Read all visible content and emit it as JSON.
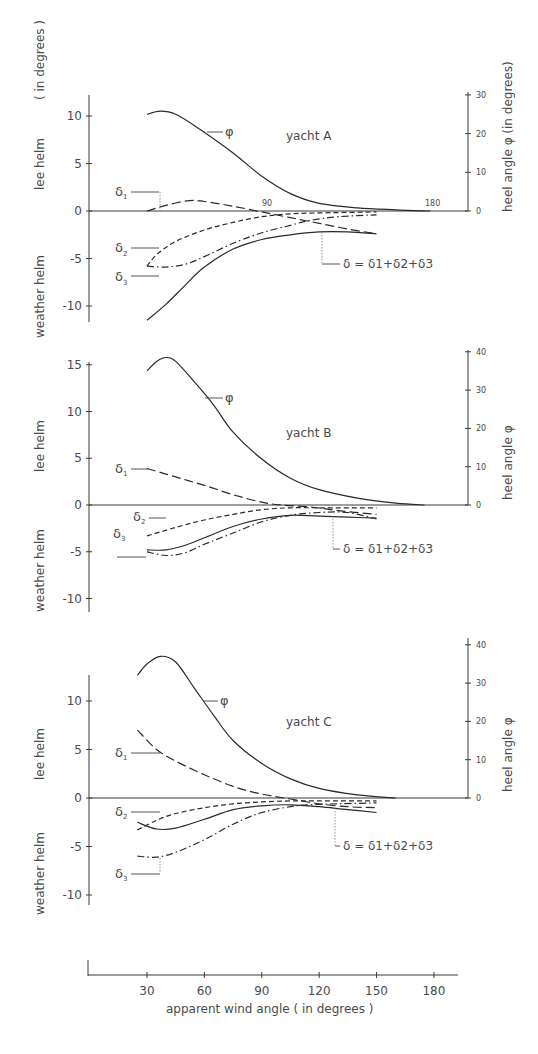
{
  "figure": {
    "x_axis_label": "apparent wind angle ( in degrees )",
    "x_ticks": [
      "30",
      "60",
      "90",
      "120",
      "150",
      "180"
    ],
    "left_axis_label_upper": "lee helm",
    "left_axis_label_lower": "weather helm",
    "left_axis_unit": "( in degrees )",
    "right_axis_label_A": "heel angle φ (in degrees)",
    "right_axis_label_BC": "heel angle φ",
    "formula": "δ = δ1+δ2+δ3",
    "phi_label": "φ"
  },
  "chart_data": [
    {
      "type": "line",
      "title": "yacht A",
      "xlabel": "apparent wind angle (in degrees)",
      "ylabel": "lee helm / weather helm (in degrees)",
      "ylabel_right": "heel angle φ (in degrees)",
      "left_ticks": [
        10,
        5,
        0,
        -5,
        -10
      ],
      "right_ticks": [
        0,
        10,
        20,
        30
      ],
      "inline_x_ticks": [
        "90",
        "180"
      ],
      "ylim": [
        -11.5,
        12
      ],
      "ylim_right": [
        0,
        30
      ],
      "series": [
        {
          "name": "φ",
          "axis": "right",
          "style": "solid",
          "points": [
            [
              30,
              25
            ],
            [
              37,
              25.8
            ],
            [
              45,
              25
            ],
            [
              58,
              21
            ],
            [
              75,
              15
            ],
            [
              90,
              9
            ],
            [
              105,
              4.5
            ],
            [
              120,
              2
            ],
            [
              140,
              0.8
            ],
            [
              160,
              0.3
            ],
            [
              178,
              0
            ]
          ]
        },
        {
          "name": "δ1",
          "axis": "left",
          "style": "longdash",
          "points": [
            [
              30,
              0
            ],
            [
              40,
              0.6
            ],
            [
              52,
              1.1
            ],
            [
              60,
              1
            ],
            [
              75,
              0.5
            ],
            [
              90,
              -0.1
            ],
            [
              105,
              -0.7
            ],
            [
              120,
              -1.3
            ],
            [
              135,
              -1.9
            ],
            [
              150,
              -2.4
            ]
          ]
        },
        {
          "name": "δ2",
          "axis": "left",
          "style": "dash",
          "points": [
            [
              30,
              -5.8
            ],
            [
              35,
              -4.6
            ],
            [
              45,
              -3.2
            ],
            [
              60,
              -2
            ],
            [
              75,
              -1.2
            ],
            [
              90,
              -0.6
            ],
            [
              105,
              -0.3
            ],
            [
              120,
              -0.2
            ],
            [
              150,
              -0.1
            ]
          ]
        },
        {
          "name": "δ3",
          "axis": "left",
          "style": "dashdot",
          "points": [
            [
              30,
              -5.8
            ],
            [
              40,
              -5.9
            ],
            [
              50,
              -5.6
            ],
            [
              60,
              -4.8
            ],
            [
              75,
              -3.4
            ],
            [
              90,
              -2.3
            ],
            [
              105,
              -1.5
            ],
            [
              115,
              -1
            ],
            [
              130,
              -0.6
            ],
            [
              150,
              -0.4
            ]
          ]
        },
        {
          "name": "δ = δ1+δ2+δ3",
          "axis": "left",
          "style": "solid",
          "points": [
            [
              30,
              -11.5
            ],
            [
              40,
              -9.8
            ],
            [
              50,
              -7.8
            ],
            [
              60,
              -5.9
            ],
            [
              75,
              -4
            ],
            [
              90,
              -3
            ],
            [
              105,
              -2.5
            ],
            [
              120,
              -2.2
            ],
            [
              135,
              -2.2
            ],
            [
              150,
              -2.4
            ]
          ]
        }
      ]
    },
    {
      "type": "line",
      "title": "yacht B",
      "xlabel": "apparent wind angle (in degrees)",
      "ylabel": "lee helm / weather helm",
      "ylabel_right": "heel angle φ",
      "left_ticks": [
        15,
        10,
        5,
        0,
        -5,
        -10
      ],
      "right_ticks": [
        0,
        10,
        20,
        30,
        40
      ],
      "ylim": [
        -10.5,
        16
      ],
      "ylim_right": [
        0,
        40
      ],
      "series": [
        {
          "name": "φ",
          "axis": "right",
          "style": "solid",
          "points": [
            [
              30,
              35
            ],
            [
              35,
              37.5
            ],
            [
              40,
              38.5
            ],
            [
              45,
              37.5
            ],
            [
              55,
              32
            ],
            [
              65,
              26
            ],
            [
              75,
              19
            ],
            [
              90,
              12
            ],
            [
              105,
              7
            ],
            [
              120,
              4
            ],
            [
              140,
              1.8
            ],
            [
              160,
              0.5
            ],
            [
              175,
              0
            ]
          ]
        },
        {
          "name": "δ1",
          "axis": "left",
          "style": "longdash",
          "points": [
            [
              30,
              3.9
            ],
            [
              45,
              3
            ],
            [
              60,
              2.1
            ],
            [
              75,
              1.1
            ],
            [
              90,
              0.3
            ],
            [
              100,
              0
            ],
            [
              115,
              -0.2
            ],
            [
              130,
              -0.6
            ],
            [
              150,
              -1
            ]
          ]
        },
        {
          "name": "δ2",
          "axis": "left",
          "style": "dash",
          "points": [
            [
              30,
              -3.3
            ],
            [
              45,
              -2.4
            ],
            [
              60,
              -1.6
            ],
            [
              75,
              -1
            ],
            [
              90,
              -0.5
            ],
            [
              105,
              -0.3
            ],
            [
              120,
              -0.3
            ],
            [
              150,
              -0.3
            ]
          ]
        },
        {
          "name": "δ3",
          "axis": "left",
          "style": "dashdot",
          "points": [
            [
              30,
              -5
            ],
            [
              40,
              -5.4
            ],
            [
              50,
              -5.1
            ],
            [
              60,
              -4.2
            ],
            [
              75,
              -3
            ],
            [
              90,
              -1.8
            ],
            [
              105,
              -1.1
            ],
            [
              120,
              -0.8
            ],
            [
              135,
              -0.8
            ],
            [
              150,
              -1.5
            ]
          ]
        },
        {
          "name": "δ = δ1+δ2+δ3",
          "axis": "left",
          "style": "solid",
          "points": [
            [
              30,
              -4.8
            ],
            [
              40,
              -4.8
            ],
            [
              50,
              -4.3
            ],
            [
              60,
              -3.5
            ],
            [
              75,
              -2.3
            ],
            [
              90,
              -1.5
            ],
            [
              105,
              -1.1
            ],
            [
              120,
              -1.2
            ],
            [
              135,
              -1.3
            ],
            [
              150,
              -1.4
            ]
          ]
        }
      ]
    },
    {
      "type": "line",
      "title": "yacht C",
      "xlabel": "apparent wind angle (in degrees)",
      "ylabel": "lee helm / weather helm",
      "ylabel_right": "heel angle φ",
      "left_ticks": [
        10,
        5,
        0,
        -5,
        -10
      ],
      "right_ticks": [
        0,
        10,
        20,
        30,
        40
      ],
      "ylim": [
        -11,
        12.5
      ],
      "ylim_right": [
        0,
        40
      ],
      "series": [
        {
          "name": "φ",
          "axis": "right",
          "style": "solid",
          "points": [
            [
              25,
              32
            ],
            [
              30,
              35
            ],
            [
              37,
              37
            ],
            [
              45,
              35.5
            ],
            [
              55,
              28.5
            ],
            [
              65,
              21.5
            ],
            [
              75,
              15
            ],
            [
              90,
              9
            ],
            [
              105,
              5
            ],
            [
              120,
              2.5
            ],
            [
              140,
              0.8
            ],
            [
              160,
              0
            ]
          ]
        },
        {
          "name": "δ1",
          "axis": "left",
          "style": "longdash",
          "points": [
            [
              25,
              7
            ],
            [
              35,
              5
            ],
            [
              45,
              3.8
            ],
            [
              60,
              2.4
            ],
            [
              75,
              1.2
            ],
            [
              90,
              0.4
            ],
            [
              105,
              -0.1
            ],
            [
              120,
              -0.6
            ],
            [
              135,
              -0.9
            ],
            [
              150,
              -1
            ]
          ]
        },
        {
          "name": "δ2",
          "axis": "left",
          "style": "dash",
          "points": [
            [
              25,
              -3.3
            ],
            [
              35,
              -2.3
            ],
            [
              45,
              -1.6
            ],
            [
              60,
              -1
            ],
            [
              75,
              -0.6
            ],
            [
              90,
              -0.4
            ],
            [
              105,
              -0.3
            ],
            [
              120,
              -0.3
            ],
            [
              150,
              -0.3
            ]
          ]
        },
        {
          "name": "δ3",
          "axis": "left",
          "style": "dashdot",
          "points": [
            [
              25,
              -6
            ],
            [
              35,
              -6.1
            ],
            [
              45,
              -5.6
            ],
            [
              60,
              -4.3
            ],
            [
              75,
              -2.7
            ],
            [
              90,
              -1.5
            ],
            [
              105,
              -0.9
            ],
            [
              115,
              -0.7
            ],
            [
              130,
              -0.6
            ],
            [
              150,
              -0.5
            ]
          ]
        },
        {
          "name": "δ = δ1+δ2+δ3",
          "axis": "left",
          "style": "solid",
          "points": [
            [
              25,
              -2.5
            ],
            [
              35,
              -3.2
            ],
            [
              45,
              -3.1
            ],
            [
              60,
              -2.2
            ],
            [
              75,
              -1.2
            ],
            [
              90,
              -0.8
            ],
            [
              105,
              -0.7
            ],
            [
              120,
              -0.9
            ],
            [
              135,
              -1.2
            ],
            [
              150,
              -1.5
            ]
          ]
        }
      ]
    }
  ]
}
